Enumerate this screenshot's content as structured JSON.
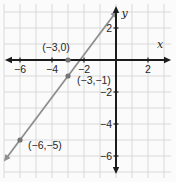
{
  "chart_data": {
    "type": "line",
    "title": "",
    "xlabel": "x",
    "ylabel": "y",
    "xlim": [
      -7,
      3
    ],
    "ylim": [
      -7,
      3.5
    ],
    "grid": true,
    "grid_unit": 1,
    "x_ticks": [
      -6,
      -4,
      -2,
      2
    ],
    "x_tick_labels": [
      "−6",
      "−4",
      "−2",
      "2"
    ],
    "y_ticks": [
      2,
      -2,
      -4,
      -6
    ],
    "y_tick_labels": [
      "2",
      "−2",
      "−4",
      "−6"
    ],
    "line": {
      "points_on_line": [
        [
          -6,
          -5
        ],
        [
          -3,
          -1
        ]
      ],
      "slope": 1.3333,
      "y_intercept": 3,
      "x_intercept": -2.25,
      "arrowheads_both_ends": true
    },
    "marked_points": [
      {
        "x": -3,
        "y": 0,
        "label": "(−3,0)",
        "on_line": false
      },
      {
        "x": -3,
        "y": -1,
        "label": "(−3,−1)",
        "on_line": true
      },
      {
        "x": -6,
        "y": -5,
        "label": "(−6,−5)",
        "on_line": true
      }
    ]
  },
  "colors": {
    "background": "#fbfbfb",
    "grid": "#d9d9d9",
    "axis": "#1c1c1c",
    "line": "#8f8f8f",
    "point": "#757575",
    "text": "#262626"
  }
}
